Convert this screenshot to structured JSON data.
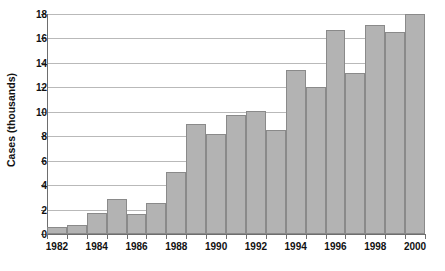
{
  "chart_data": {
    "type": "bar",
    "title": "",
    "subtitle": "",
    "xlabel": "",
    "ylabel": "Cases (thousands)",
    "ylim": [
      0,
      18
    ],
    "ytick_values": [
      0,
      2,
      4,
      6,
      8,
      10,
      12,
      14,
      16,
      18
    ],
    "ytick_labels": [
      "0",
      "2",
      "4",
      "6",
      "8",
      "10",
      "12",
      "14",
      "16",
      "18"
    ],
    "grid": true,
    "legend": "none",
    "xtick_labels": [
      "1982",
      "1984",
      "1986",
      "1988",
      "1990",
      "1992",
      "1994",
      "1996",
      "1998",
      "2000"
    ],
    "categories": [
      "1982",
      "1983",
      "1984",
      "1985",
      "1986",
      "1987",
      "1988",
      "1989",
      "1990",
      "1991",
      "1992",
      "1993",
      "1994",
      "1995",
      "1996",
      "1997",
      "1998",
      "1999",
      "2000"
    ],
    "values": [
      0.6,
      0.7,
      1.7,
      2.9,
      1.65,
      2.55,
      5.1,
      9.0,
      8.2,
      9.7,
      10.1,
      8.5,
      13.4,
      12.0,
      16.7,
      13.2,
      17.1,
      16.5,
      18.0
    ],
    "bar_color": "#b3b3b3",
    "bar_border_color": "#8a8a8a",
    "grid_color": "#b9b9b9",
    "axis_color": "#6e6e6e",
    "text_color": "#111111"
  }
}
